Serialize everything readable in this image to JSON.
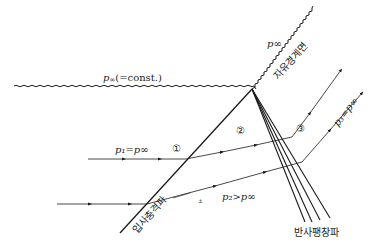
{
  "diagram": {
    "type": "shock-reflection-free-boundary",
    "labels": {
      "p_inf_top": "p∞",
      "p_inf_const_p": "p",
      "p_inf_const_sub": "∞",
      "p_inf_const_rest": "(=const.)",
      "free_boundary": "자유경계면",
      "incident_shock": "입사충격파",
      "reflected_expansion": "반사팽창파",
      "region1": "①",
      "region2": "②",
      "region3": "③",
      "p1_eq": "p₁=p∞",
      "p2_gt": "p₂>p∞",
      "p3_eq": "p₃=p∞",
      "small_mark": "±"
    },
    "colors": {
      "line": "#1a1a1a",
      "text": "#222222",
      "background": "#ffffff"
    }
  }
}
